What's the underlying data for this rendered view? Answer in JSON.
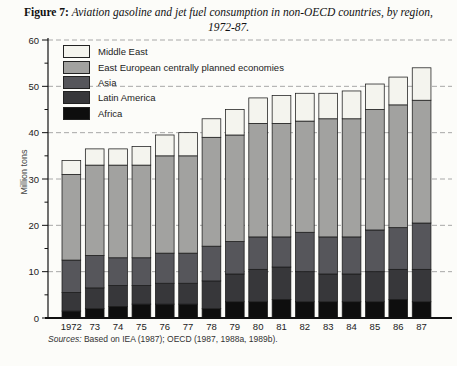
{
  "figure": {
    "label": "Figure 7:",
    "title_rest": "Aviation gasoline and jet fuel consumption in non-OECD countries, by region,",
    "title_line2": "1972-87."
  },
  "sources": {
    "prefix": "Sources:",
    "text": "Based on IEA (1987); OECD (1987, 1988a, 1989b)."
  },
  "chart_data": {
    "type": "bar",
    "stacked": true,
    "title": "Aviation gasoline and jet fuel consumption in non-OECD countries, by region, 1972-87",
    "ylabel": "Million tons",
    "ylim": [
      0,
      60
    ],
    "ytick_step": 10,
    "ytick_minor_step": 5,
    "yticks": [
      "0",
      "10",
      "20",
      "30",
      "40",
      "50",
      "60"
    ],
    "grid": "horizontal dashed lines at 10-unit intervals",
    "legend_position": "top-left inside plot area, no box",
    "legend_order_top_to_bottom": [
      "Middle East",
      "East European centrally planned economies",
      "Asia",
      "Latin America",
      "Africa"
    ],
    "categories": [
      "1972",
      "73",
      "74",
      "75",
      "76",
      "77",
      "78",
      "79",
      "80",
      "81",
      "82",
      "83",
      "84",
      "85",
      "86",
      "87"
    ],
    "series": [
      {
        "name": "Africa",
        "color": "#0e0e0e",
        "values": [
          1.5,
          2.0,
          2.5,
          3.0,
          3.0,
          3.0,
          2.0,
          3.5,
          3.5,
          4.0,
          3.5,
          3.5,
          3.5,
          3.5,
          4.0,
          3.5
        ]
      },
      {
        "name": "Latin America",
        "color": "#37373a",
        "values": [
          4.0,
          4.5,
          4.5,
          4.0,
          4.5,
          4.5,
          6.0,
          6.0,
          7.0,
          7.0,
          6.5,
          6.0,
          6.0,
          6.5,
          6.5,
          7.0
        ]
      },
      {
        "name": "Asia",
        "color": "#56565b",
        "values": [
          7.0,
          7.0,
          6.0,
          6.0,
          6.5,
          6.5,
          7.5,
          7.0,
          7.0,
          6.5,
          8.5,
          8.0,
          8.0,
          9.0,
          9.0,
          10.0
        ]
      },
      {
        "name": "East European centrally planned economies",
        "color": "#a2a2a0",
        "values": [
          18.5,
          19.5,
          20.0,
          20.0,
          21.0,
          21.0,
          23.5,
          23.0,
          24.5,
          24.5,
          24.0,
          25.5,
          25.5,
          26.0,
          26.5,
          26.5
        ]
      },
      {
        "name": "Middle East",
        "color": "#f4f4ee",
        "values": [
          3.0,
          3.5,
          3.5,
          4.0,
          4.5,
          5.0,
          4.0,
          5.5,
          5.5,
          6.0,
          6.0,
          5.5,
          6.0,
          5.5,
          6.0,
          7.0
        ]
      }
    ],
    "stack_totals": [
      34,
      36.5,
      36.5,
      37,
      39.5,
      40,
      43,
      45,
      47.5,
      48,
      48.5,
      48.5,
      49,
      50.5,
      52,
      54
    ],
    "units": "Million tons",
    "bar_outline_color": "#1a1a1a",
    "gridline_color": "#a8a8a8",
    "axis_color": "#111111"
  }
}
